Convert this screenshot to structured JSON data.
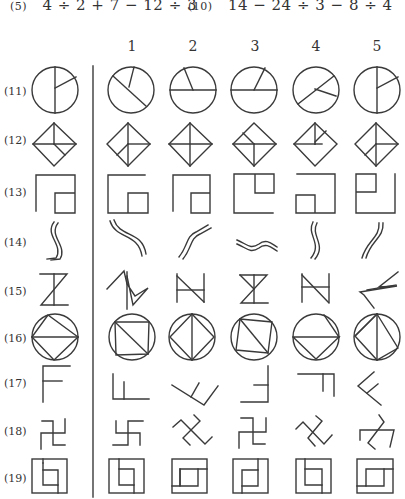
{
  "equations": [
    {
      "number": "(5)",
      "expression": "4 ÷ 2 + 7 − 12 ÷ 3"
    },
    {
      "number": "(10)",
      "expression": "14 − 24 ÷ 3 − 8 ÷ 4"
    }
  ],
  "column_headers": [
    "1",
    "2",
    "3",
    "4",
    "5"
  ],
  "rows": [
    {
      "label": "(11)",
      "shape": "circle-divided"
    },
    {
      "label": "(12)",
      "shape": "diamond-divided"
    },
    {
      "label": "(13)",
      "shape": "square-with-inner-square"
    },
    {
      "label": "(14)",
      "shape": "double-wavy-line"
    },
    {
      "label": "(15)",
      "shape": "z-hourglass"
    },
    {
      "label": "(16)",
      "shape": "circle-inscribed-polygon"
    },
    {
      "label": "(17)",
      "shape": "f-shape"
    },
    {
      "label": "(18)",
      "shape": "swastika-like-cross"
    },
    {
      "label": "(19)",
      "shape": "nested-squares"
    }
  ],
  "colors": {
    "ink": "#3a3a3a",
    "paper": "#ffffff"
  }
}
